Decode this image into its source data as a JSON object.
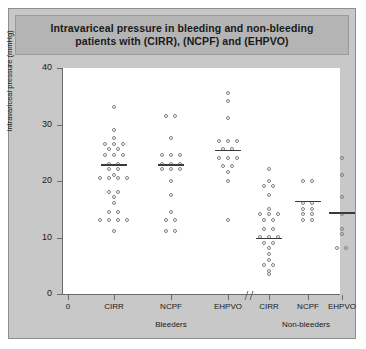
{
  "figure": {
    "title": "Intravariceal pressure in bleeding and non-bleeding\npatients with (CIRR), (NCPF) and (EHPVO)",
    "panel_bg": "#c8c8c8",
    "title_bar_bg": "#b4b4b4",
    "plot_bg": "#ffffff",
    "axis_color": "#6a6a6a",
    "point_color": "#808080",
    "mean_line_color": "#3a3a3a"
  },
  "chart_data": {
    "type": "scatter",
    "title": "Intravariceal pressure in bleeding and non-bleeding patients with (CIRR), (NCPF) and (EHPVO)",
    "xlabel": "",
    "ylabel": "Intravariceal pressure (mmHg)",
    "ylim": [
      0,
      40
    ],
    "yticks": [
      0,
      10,
      20,
      30,
      40
    ],
    "grid": false,
    "legend": "none",
    "axis_break": true,
    "axis_break_note": "// break on x-axis between Bleeders EHPVO and Non-bleeders CIRR",
    "x_origin_label": "0",
    "groups": [
      {
        "group": "Bleeders",
        "categories": [
          "CIRR",
          "NCPF",
          "EHPVO"
        ]
      },
      {
        "group": "Non-bleeders",
        "categories": [
          "CIRR",
          "NCPF",
          "EHPVO"
        ]
      }
    ],
    "series": [
      {
        "name": "Bleeders CIRR",
        "group": "Bleeders",
        "category": "CIRR",
        "mean": 23,
        "n": 31,
        "values": [
          33,
          29,
          27.5,
          26.5,
          26.5,
          25.5,
          25.5,
          24.5,
          24.5,
          23,
          23,
          22,
          22,
          21,
          20.5,
          20.5,
          20.5,
          18,
          18,
          17,
          16,
          14.5,
          14.5,
          13,
          13,
          13,
          13,
          11,
          26.5,
          24.5,
          20.5
        ]
      },
      {
        "name": "Bleeders NCPF",
        "group": "Bleeders",
        "category": "NCPF",
        "mean": 23,
        "n": 19,
        "values": [
          31.5,
          31.5,
          27.5,
          24.5,
          24.5,
          24.5,
          23,
          23,
          23,
          22,
          22,
          22,
          20,
          17.5,
          14.5,
          13,
          13,
          11,
          11
        ]
      },
      {
        "name": "Bleeders EHPVO",
        "group": "Bleeders",
        "category": "EHPVO",
        "mean": 25.5,
        "n": 16,
        "values": [
          35.5,
          34,
          31,
          27,
          27,
          25.5,
          25.5,
          24,
          24,
          22.5,
          22.5,
          21.5,
          20,
          13,
          27,
          24
        ]
      },
      {
        "name": "Non-bleeders CIRR",
        "group": "Non-bleeders",
        "category": "CIRR",
        "mean": 10,
        "n": 25,
        "values": [
          22,
          19,
          19,
          17.5,
          15,
          14,
          14,
          13,
          11.5,
          11.5,
          10,
          10,
          10,
          9,
          9,
          8,
          7,
          6,
          5,
          5,
          4,
          3.5,
          20,
          14,
          13
        ]
      },
      {
        "name": "Non-bleeders NCPF",
        "group": "Non-bleeders",
        "category": "NCPF",
        "mean": 16.5,
        "n": 10,
        "values": [
          20,
          20,
          16,
          15,
          15,
          14,
          14,
          13,
          13,
          16
        ]
      },
      {
        "name": "Non-bleeders EHPVO",
        "group": "Non-bleeders",
        "category": "EHPVO",
        "mean": 14.5,
        "n": 8,
        "values": [
          24,
          21,
          17,
          14,
          11.5,
          10.5,
          8,
          8
        ]
      }
    ]
  },
  "axis": {
    "y_ticks": [
      {
        "label": "40",
        "value": 40
      },
      {
        "label": "30",
        "value": 30
      },
      {
        "label": "20",
        "value": 20
      },
      {
        "label": "10",
        "value": 10
      },
      {
        "label": "0",
        "value": 0
      }
    ],
    "x_ticks": [
      {
        "label": "0"
      },
      {
        "label": "CIRR"
      },
      {
        "label": "NCPF"
      },
      {
        "label": "EHPVO"
      },
      {
        "label": "CIRR"
      },
      {
        "label": "NCPF"
      },
      {
        "label": "EHPVO"
      }
    ],
    "group_labels": [
      "Bleeders",
      "Non-bleeders"
    ]
  }
}
